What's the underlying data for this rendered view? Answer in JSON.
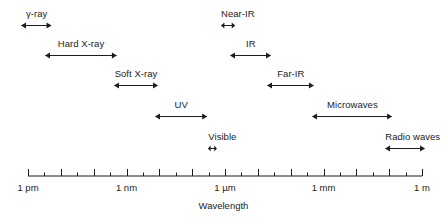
{
  "figure": {
    "axis_title": "Wavelength",
    "line_color": "#1c1c1c",
    "background": "#ffffff"
  },
  "axis": {
    "label_left": "1 pm",
    "label_mid_left": "1 nm",
    "label_mid": "1 µm",
    "label_mid_right": "1 mm",
    "label_right": "1 m",
    "tick_labels": [
      "1 pm",
      "1 nm",
      "1 µm",
      "1 mm",
      "1 m"
    ],
    "tick_label_decades": [
      0,
      3,
      6,
      9,
      12
    ],
    "decade_min": 0,
    "decade_max": 12,
    "minor_ticks_per_decade": 1
  },
  "bands": [
    {
      "name": "gamma-ray",
      "label": "γ-ray",
      "row": 0,
      "start_decade": -0.2,
      "end_decade": 0.73
    },
    {
      "name": "hard-x-ray",
      "label": "Hard X-ray",
      "row": 1,
      "start_decade": 0.52,
      "end_decade": 2.71
    },
    {
      "name": "soft-x-ray",
      "label": "Soft X-ray",
      "row": 2,
      "start_decade": 2.62,
      "end_decade": 3.96
    },
    {
      "name": "uv",
      "label": "UV",
      "row": 3,
      "start_decade": 3.87,
      "end_decade": 5.46
    },
    {
      "name": "visible",
      "label": "Visible",
      "row": 4,
      "start_decade": 5.49,
      "end_decade": 5.76
    },
    {
      "name": "near-ir",
      "label": "Near-IR",
      "row": 0,
      "start_decade": 5.88,
      "end_decade": 6.31
    },
    {
      "name": "ir",
      "label": "IR",
      "row": 1,
      "start_decade": 6.16,
      "end_decade": 7.41
    },
    {
      "name": "far-ir",
      "label": "Far-IR",
      "row": 2,
      "start_decade": 7.29,
      "end_decade": 8.72
    },
    {
      "name": "microwaves",
      "label": "Microwaves",
      "row": 3,
      "start_decade": 8.66,
      "end_decade": 11.1
    },
    {
      "name": "radio-waves",
      "label": "Radio waves",
      "row": 4,
      "start_decade": 10.88,
      "end_decade": 12.1
    }
  ],
  "chart_data": {
    "type": "bar",
    "xlabel": "Wavelength",
    "ylabel": "",
    "xscale": "log",
    "grid": false,
    "legend": "none",
    "xlim": [
      "1 pm",
      "1 m"
    ],
    "tick_labels": [
      "1 pm",
      "1 nm",
      "1 µm",
      "1 mm",
      "1 m"
    ],
    "categories": [
      "γ-ray",
      "Hard X-ray",
      "Soft X-ray",
      "UV",
      "Visible",
      "Near-IR",
      "IR",
      "Far-IR",
      "Microwaves",
      "Radio waves"
    ],
    "ranges_m": [
      [
        6.3e-13,
        5.4e-12
      ],
      [
        3.3e-12,
        5.1e-10
      ],
      [
        4.2e-10,
        9.1e-09
      ],
      [
        7.4e-09,
        2.9e-07
      ],
      [
        3.1e-07,
        5.8e-07
      ],
      [
        7.6e-07,
        2e-06
      ],
      [
        1.4e-06,
        2.6e-05
      ],
      [
        2e-05,
        0.00052
      ],
      [
        0.00046,
        0.13
      ],
      [
        0.076,
        1.3
      ]
    ]
  }
}
